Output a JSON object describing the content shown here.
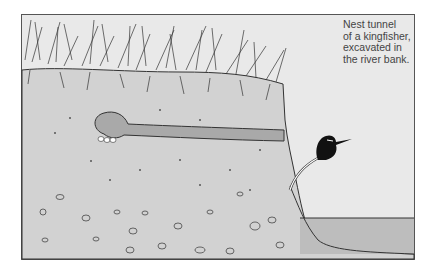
{
  "illustration": {
    "subject": "Cross-section of a river bank with a kingfisher nest tunnel",
    "caption_lines": [
      "Nest tunnel",
      "of a kingfisher,",
      "excavated in",
      "the river bank."
    ],
    "elements": [
      "grass-tufts",
      "soil-bank",
      "nest-tunnel",
      "eggs",
      "kingfisher",
      "branch",
      "river-water",
      "pebbles"
    ],
    "colors": {
      "background": "#e9e9e9",
      "soil": "#d2d2d2",
      "tunnel": "#a9a9a9",
      "water": "#bdbdbd",
      "line": "#333333"
    }
  }
}
